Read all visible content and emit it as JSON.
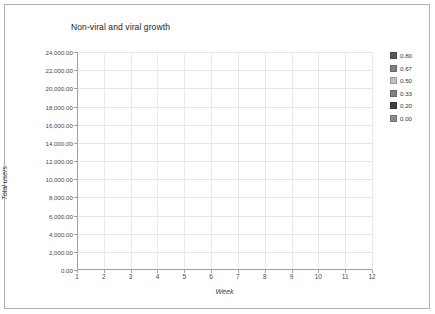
{
  "chart_data": {
    "type": "line",
    "title": "Non-viral and viral growth",
    "xlabel": "Week",
    "ylabel": "Total users",
    "x": [
      1,
      2,
      3,
      4,
      5,
      6,
      7,
      8,
      9,
      10,
      11,
      12
    ],
    "xlim": [
      1,
      12
    ],
    "ylim": [
      0,
      24000
    ],
    "ytick_values": [
      0,
      2000,
      4000,
      6000,
      8000,
      10000,
      12000,
      14000,
      16000,
      18000,
      20000,
      22000,
      24000
    ],
    "ytick_labels": [
      "0.00",
      "2,000.00",
      "4,000.00",
      "6,000.00",
      "8,000.00",
      "10,000.00",
      "12,000.00",
      "14,000.00",
      "16,000.00",
      "18,000.00",
      "20,000.00",
      "22,000.00",
      "24,000.00"
    ],
    "xtick_labels": [
      "1",
      "2",
      "3",
      "4",
      "5",
      "6",
      "7",
      "8",
      "9",
      "10",
      "11",
      "12"
    ],
    "grid": true,
    "legend_position": "right",
    "series": [
      {
        "name": "0.80",
        "color": "#595959",
        "values": [
          0,
          2090,
          4180,
          6270,
          8360,
          10450,
          12540,
          14630,
          16720,
          18810,
          20900,
          22990
        ]
      },
      {
        "name": "0.67",
        "color": "#808080",
        "values": [
          0,
          1500,
          3000,
          4500,
          6000,
          7500,
          9000,
          10500,
          12000,
          13500,
          15000,
          16500
        ]
      },
      {
        "name": "0.50",
        "color": "#bfbfbf",
        "values": [
          0,
          1091,
          2182,
          3273,
          4364,
          5455,
          6545,
          7636,
          8727,
          9818,
          10909,
          12000
        ]
      },
      {
        "name": "0.33",
        "color": "#7f7f7f",
        "values": [
          0,
          845,
          1691,
          2536,
          3382,
          4227,
          5073,
          5918,
          6764,
          7609,
          8455,
          9300
        ]
      },
      {
        "name": "0.20",
        "color": "#404040",
        "values": [
          0,
          727,
          1455,
          2182,
          2909,
          3636,
          4364,
          5091,
          5818,
          6545,
          7273,
          8000
        ]
      },
      {
        "name": "0.00",
        "color": "#8c8c8c",
        "values": [
          0,
          582,
          1164,
          1745,
          2327,
          2909,
          3491,
          4073,
          4655,
          5236,
          5818,
          6400
        ]
      }
    ]
  }
}
